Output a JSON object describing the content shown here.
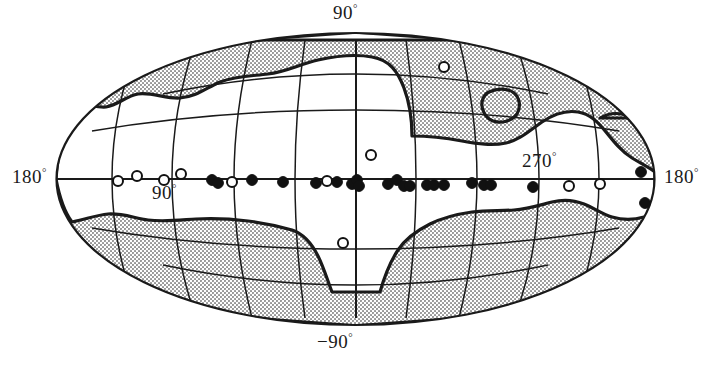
{
  "figure": {
    "type": "all-sky-map",
    "projection": "Aitoff-Hammer equal-area all-sky projection",
    "coordinate_system": "galactic",
    "background_color": "#ffffff",
    "line_color": "#1a1a1a",
    "shading_color": "#9a9a9a",
    "shading_description": "halftone dotted grey regions covering high galactic latitudes (survey-excluded / non-surveyed zones)"
  },
  "labels": {
    "top": "90",
    "top_degree": "°",
    "bottom": "−90",
    "bottom_degree": "°",
    "left_180": "180",
    "left_180_degree": "°",
    "right_180": "180",
    "right_180_degree": "°",
    "inner_90": "90",
    "inner_90_degree": "°",
    "inner_270": "270",
    "inner_270_degree": "°"
  },
  "chart_data": {
    "type": "scatter",
    "title": "",
    "xlabel": "Galactic longitude",
    "ylabel": "Galactic latitude",
    "projection": "aitoff",
    "xlim": [
      180,
      -180
    ],
    "ylim": [
      -90,
      90
    ],
    "grid": true,
    "grid_meridian_step_deg": 30,
    "grid_parallel_step_deg": 30,
    "legend": [
      {
        "name": "filled-circle",
        "marker": "filled circle",
        "color": "#111111"
      },
      {
        "name": "open-circle",
        "marker": "open circle",
        "color": "#ffffff"
      }
    ],
    "axis_tick_labels": [
      "180°",
      "90°",
      "270°",
      "180°",
      "90°",
      "−90°"
    ],
    "series": [
      {
        "name": "open-circle",
        "marker": "open",
        "points": [
          {
            "px": 118,
            "py": 181,
            "l": 155,
            "b": 0
          },
          {
            "px": 137,
            "py": 176,
            "l": 148,
            "b": 2
          },
          {
            "px": 164,
            "py": 180,
            "l": 138,
            "b": 0
          },
          {
            "px": 181,
            "py": 174,
            "l": 132,
            "b": 3
          },
          {
            "px": 232,
            "py": 182,
            "l": 112,
            "b": 0
          },
          {
            "px": 327,
            "py": 181,
            "l": 74,
            "b": 0
          },
          {
            "px": 371,
            "py": 155,
            "l": 57,
            "b": 11
          },
          {
            "px": 444,
            "py": 67,
            "l": 30,
            "b": 42
          },
          {
            "px": 343,
            "py": 243,
            "l": 68,
            "b": -26
          },
          {
            "px": 569,
            "py": 186,
            "l": -75,
            "b": -1
          },
          {
            "px": 600,
            "py": 184,
            "l": -88,
            "b": 0
          }
        ]
      },
      {
        "name": "filled-circle",
        "marker": "filled",
        "points": [
          {
            "px": 212,
            "py": 180,
            "l": 120,
            "b": 1
          },
          {
            "px": 218,
            "py": 183,
            "l": 118,
            "b": -1
          },
          {
            "px": 252,
            "py": 180,
            "l": 105,
            "b": 1
          },
          {
            "px": 283,
            "py": 182,
            "l": 93,
            "b": 0
          },
          {
            "px": 316,
            "py": 183,
            "l": 80,
            "b": 0
          },
          {
            "px": 337,
            "py": 182,
            "l": 72,
            "b": 0
          },
          {
            "px": 352,
            "py": 184,
            "l": 66,
            "b": -1
          },
          {
            "px": 357,
            "py": 180,
            "l": 64,
            "b": 1
          },
          {
            "px": 359,
            "py": 186,
            "l": 63,
            "b": -2
          },
          {
            "px": 388,
            "py": 184,
            "l": 52,
            "b": -1
          },
          {
            "px": 397,
            "py": 180,
            "l": 48,
            "b": 1
          },
          {
            "px": 404,
            "py": 186,
            "l": 45,
            "b": -2
          },
          {
            "px": 410,
            "py": 186,
            "l": 43,
            "b": -2
          },
          {
            "px": 427,
            "py": 185,
            "l": 36,
            "b": -2
          },
          {
            "px": 434,
            "py": 185,
            "l": 33,
            "b": -2
          },
          {
            "px": 444,
            "py": 185,
            "l": 29,
            "b": -2
          },
          {
            "px": 472,
            "py": 183,
            "l": 18,
            "b": -1
          },
          {
            "px": 484,
            "py": 185,
            "l": 13,
            "b": -2
          },
          {
            "px": 491,
            "py": 185,
            "l": 10,
            "b": -2
          },
          {
            "px": 533,
            "py": 187,
            "l": -7,
            "b": -2
          },
          {
            "px": 641,
            "py": 172,
            "l": -51,
            "b": 4
          },
          {
            "px": 645,
            "py": 203,
            "l": -53,
            "b": -7
          }
        ]
      }
    ]
  }
}
